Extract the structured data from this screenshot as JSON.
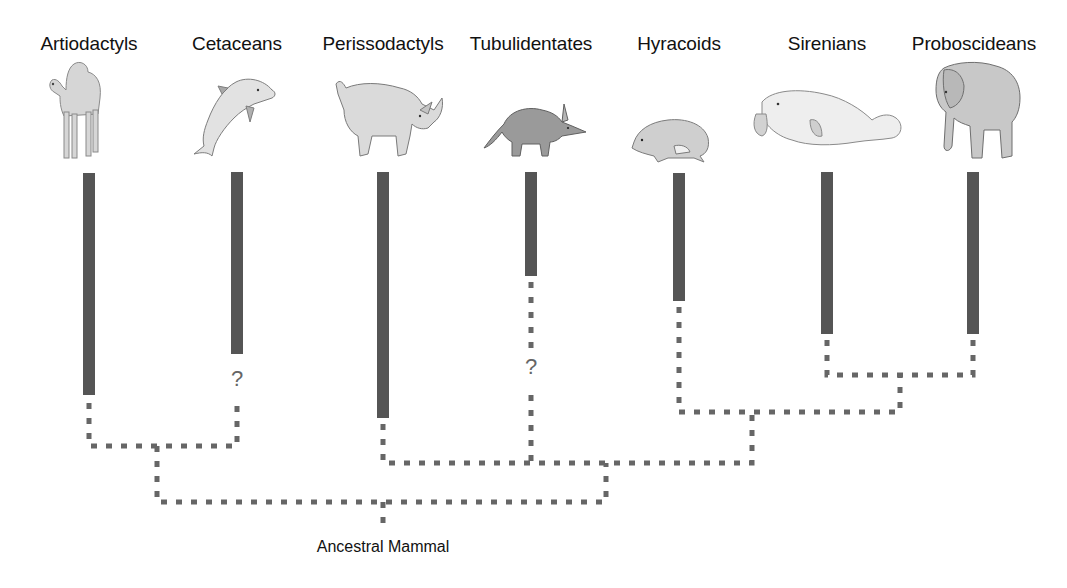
{
  "colors": {
    "bar": "#555555",
    "dash": "#666666",
    "text": "#111111"
  },
  "taxa": [
    {
      "name": "Artiodactyls",
      "animal": "camel",
      "x": 89,
      "bar_top": 173,
      "bar_bottom": 395
    },
    {
      "name": "Cetaceans",
      "animal": "dolphin",
      "x": 237,
      "bar_top": 172,
      "bar_bottom": 354,
      "uncertain": "?"
    },
    {
      "name": "Perissodactyls",
      "animal": "rhinoceros",
      "x": 383,
      "bar_top": 172,
      "bar_bottom": 418
    },
    {
      "name": "Tubulidentates",
      "animal": "aardvark",
      "x": 531,
      "bar_top": 172,
      "bar_bottom": 276,
      "uncertain": "?"
    },
    {
      "name": "Hyracoids",
      "animal": "hyrax",
      "x": 679,
      "bar_top": 173,
      "bar_bottom": 301
    },
    {
      "name": "Sirenians",
      "animal": "manatee",
      "x": 827,
      "bar_top": 172,
      "bar_bottom": 334
    },
    {
      "name": "Proboscideans",
      "animal": "elephant",
      "x": 973,
      "bar_top": 172,
      "bar_bottom": 334
    }
  ],
  "clades": [
    {
      "members": [
        "Artiodactyls",
        "Cetaceans"
      ],
      "join_y": 446
    },
    {
      "members": [
        "Sirenians",
        "Proboscideans"
      ],
      "join_y": 375
    },
    {
      "members": [
        "Hyracoids",
        "Sirenians+Proboscideans"
      ],
      "join_y": 412
    },
    {
      "members": [
        "Perissodactyls",
        "Tubulidentates",
        "Hyracoids+Sirenians+Proboscideans"
      ],
      "join_y": 463
    },
    {
      "members": [
        "Artiodactyls+Cetaceans",
        "Perissodactyls+..."
      ],
      "join_y": 502
    }
  ],
  "root": {
    "label": "Ancestral Mammal"
  },
  "question_mark": "?"
}
